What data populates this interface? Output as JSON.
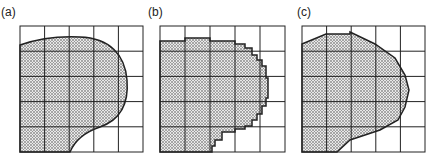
{
  "figure": {
    "panels": [
      {
        "label": "(a)",
        "description": "smooth curved region overlaid on 5x5 grid"
      },
      {
        "label": "(b)",
        "description": "staircase pixel approximation of region on 5x5 grid"
      },
      {
        "label": "(c)",
        "description": "polygonal approximation of region on 5x5 grid"
      }
    ],
    "grid": {
      "rows": 5,
      "cols": 5
    },
    "colors": {
      "line": "#222222",
      "fill_dot": "#555555",
      "background": "#ffffff"
    }
  }
}
